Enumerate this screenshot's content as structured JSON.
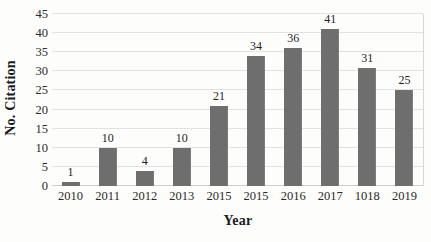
{
  "chart_data": {
    "type": "bar",
    "title": "",
    "xlabel": "Year",
    "ylabel": "No. Citation",
    "categories": [
      "2010",
      "2011",
      "2012",
      "2013",
      "2015",
      "2015",
      "2016",
      "2017",
      "1018",
      "2019"
    ],
    "values": [
      1,
      10,
      4,
      10,
      21,
      34,
      36,
      41,
      31,
      25
    ],
    "value_labels": [
      "1",
      "10",
      "4",
      "10",
      "21",
      "34",
      "36",
      "41",
      "31",
      "25"
    ],
    "ylim": [
      0,
      45
    ],
    "ytick_labels": [
      "0",
      "5",
      "10",
      "15",
      "20",
      "25",
      "30",
      "35",
      "40",
      "45"
    ],
    "ytick_values": [
      0,
      5,
      10,
      15,
      20,
      25,
      30,
      35,
      40,
      45
    ],
    "grid": true,
    "legend": "none",
    "bar_color": "#6e6e6e",
    "gridline_color": "#e2e2e0",
    "background_color": "#fdfdfb",
    "text_color": "#1f1f1f"
  }
}
